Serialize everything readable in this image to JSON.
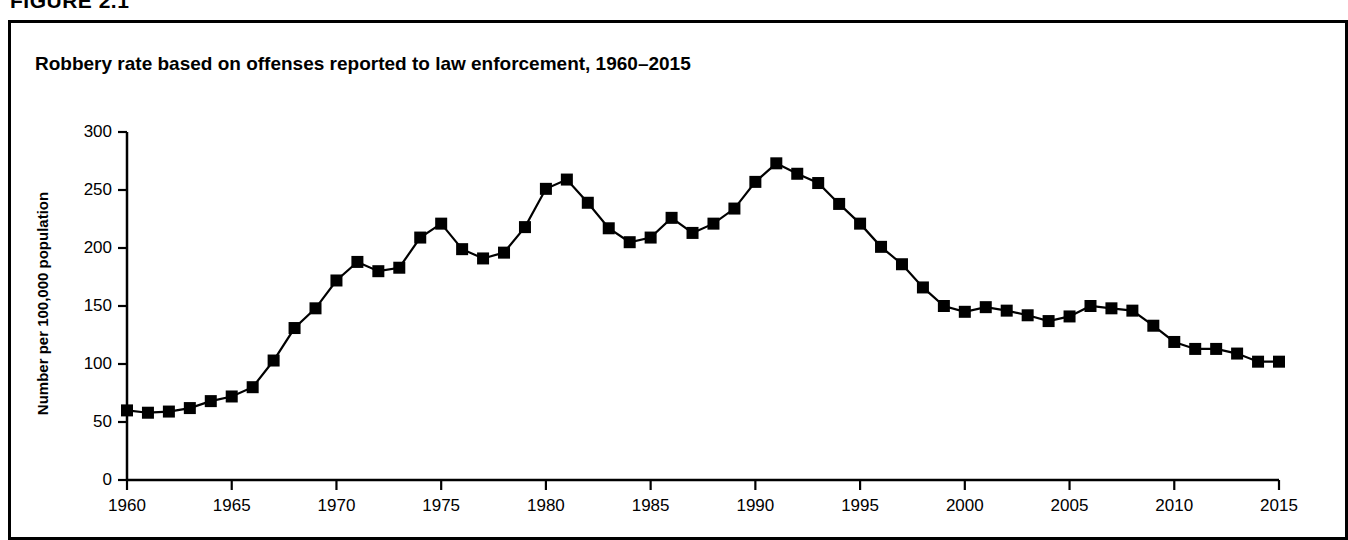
{
  "figure": {
    "caption": "FIGURE 2.1",
    "title": "Robbery rate based on offenses reported to law enforcement, 1960–2015"
  },
  "chart_data": {
    "type": "line",
    "title": "Robbery rate based on offenses reported to law enforcement, 1960–2015",
    "xlabel": "",
    "ylabel": "Number per 100,000 population",
    "xlim": [
      1960,
      2015
    ],
    "ylim": [
      0,
      300
    ],
    "ytick_labels": [
      "0",
      "50",
      "100",
      "150",
      "200",
      "250",
      "300"
    ],
    "yticks": [
      0,
      50,
      100,
      150,
      200,
      250,
      300
    ],
    "xtick_labels": [
      "1960",
      "1965",
      "1970",
      "1975",
      "1980",
      "1985",
      "1990",
      "1995",
      "2000",
      "2005",
      "2010",
      "2015"
    ],
    "xticks": [
      1960,
      1965,
      1970,
      1975,
      1980,
      1985,
      1990,
      1995,
      2000,
      2005,
      2010,
      2015
    ],
    "grid": false,
    "legend": false,
    "marker": "square",
    "series_color": "#000000",
    "x": [
      1960,
      1961,
      1962,
      1963,
      1964,
      1965,
      1966,
      1967,
      1968,
      1969,
      1970,
      1971,
      1972,
      1973,
      1974,
      1975,
      1976,
      1977,
      1978,
      1979,
      1980,
      1981,
      1982,
      1983,
      1984,
      1985,
      1986,
      1987,
      1988,
      1989,
      1990,
      1991,
      1992,
      1993,
      1994,
      1995,
      1996,
      1997,
      1998,
      1999,
      2000,
      2001,
      2002,
      2003,
      2004,
      2005,
      2006,
      2007,
      2008,
      2009,
      2010,
      2011,
      2012,
      2013,
      2014,
      2015
    ],
    "values": [
      60,
      58,
      59,
      62,
      68,
      72,
      80,
      103,
      131,
      148,
      172,
      188,
      180,
      183,
      209,
      221,
      199,
      191,
      196,
      218,
      251,
      259,
      239,
      217,
      205,
      209,
      226,
      213,
      221,
      234,
      257,
      273,
      264,
      256,
      238,
      221,
      201,
      186,
      166,
      150,
      145,
      149,
      146,
      142,
      137,
      141,
      150,
      148,
      146,
      133,
      119,
      113,
      113,
      109,
      102,
      102
    ]
  }
}
